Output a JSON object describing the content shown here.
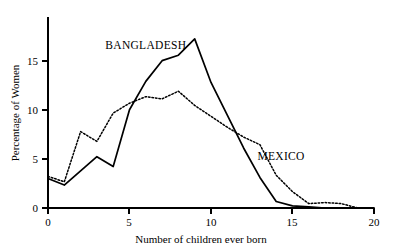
{
  "chart_data": {
    "type": "line",
    "title": "",
    "xlabel": "Number of children ever born",
    "ylabel": "Percentage of Women",
    "xlim": [
      0,
      20
    ],
    "ylim": [
      0,
      17.5
    ],
    "xticks": [
      0,
      5,
      10,
      15,
      20
    ],
    "yticks": [
      0,
      5,
      10,
      15
    ],
    "xtick_labels": [
      "0",
      "5",
      "10",
      "15",
      "20"
    ],
    "ytick_labels": [
      "0",
      "5",
      "10",
      "15"
    ],
    "grid": false,
    "legend_position": "inline-annotations",
    "x": [
      0,
      1,
      2,
      3,
      4,
      5,
      6,
      7,
      8,
      9,
      10,
      11,
      12,
      13,
      14,
      15,
      16,
      17,
      18,
      19,
      20
    ],
    "series": [
      {
        "name": "BANGLADESH",
        "style": "solid",
        "color": "#000000",
        "label_x": 6.0,
        "label_y": 14.6,
        "values": [
          2.7,
          2.1,
          3.4,
          4.7,
          3.8,
          9.0,
          11.6,
          13.5,
          14.0,
          15.5,
          11.5,
          8.5,
          5.5,
          2.8,
          0.6,
          0.2,
          0.1,
          0.0,
          0.0,
          0.0,
          0.0
        ]
      },
      {
        "name": "MEXICO",
        "style": "dotted",
        "color": "#000000",
        "label_x": 14.3,
        "label_y": 4.4,
        "values": [
          2.9,
          2.4,
          7.0,
          6.1,
          8.7,
          9.6,
          10.2,
          10.0,
          10.7,
          9.4,
          8.4,
          7.4,
          6.5,
          5.8,
          3.0,
          1.5,
          0.4,
          0.5,
          0.4,
          0.0,
          0.0
        ]
      }
    ]
  },
  "axis": {
    "x_title": "Number of children ever born",
    "y_title": "Percentage of Women"
  },
  "labels": {
    "bangladesh": "BANGLADESH",
    "mexico": "MEXICO"
  }
}
